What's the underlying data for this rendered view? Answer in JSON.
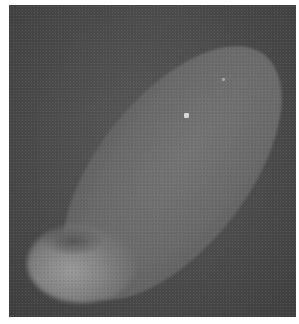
{
  "image": {
    "kind": "grayscale microscopy image",
    "subject": "elongated elliptical cell / embryo on dark background",
    "colors": {
      "background": "#4a4a4a",
      "cell_body": "#6e6e6e",
      "bright_region": "#9a9a9a",
      "border": "#ffffff",
      "spot": "#d8d8d8"
    }
  }
}
